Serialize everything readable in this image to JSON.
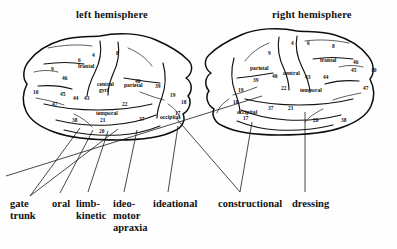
{
  "figure": {
    "background_color": "#fefefe",
    "ink_color": "#111111"
  },
  "titles": {
    "left": "left hemisphere",
    "right": "right hemisphere"
  },
  "hemispheres": {
    "left": {
      "title": "left hemisphere",
      "lobe_labels": [
        {
          "text": "frontal",
          "x": 78,
          "y": 68
        },
        {
          "text": "central",
          "x": 97,
          "y": 86
        },
        {
          "text": "gyri",
          "x": 99,
          "y": 92
        },
        {
          "text": "parietal",
          "x": 124,
          "y": 87
        },
        {
          "text": "temporal",
          "x": 96,
          "y": 115
        },
        {
          "text": "occipital",
          "x": 160,
          "y": 119
        }
      ],
      "brodmann_areas": [
        {
          "num": "4",
          "x": 92,
          "y": 57
        },
        {
          "num": "6",
          "x": 78,
          "y": 62
        },
        {
          "num": "8",
          "x": 116,
          "y": 55
        },
        {
          "num": "9",
          "x": 51,
          "y": 71
        },
        {
          "num": "46",
          "x": 62,
          "y": 80
        },
        {
          "num": "10",
          "x": 33,
          "y": 94
        },
        {
          "num": "45",
          "x": 60,
          "y": 96
        },
        {
          "num": "44",
          "x": 73,
          "y": 100
        },
        {
          "num": "43",
          "x": 84,
          "y": 100
        },
        {
          "num": "40",
          "x": 135,
          "y": 83
        },
        {
          "num": "39",
          "x": 155,
          "y": 88
        },
        {
          "num": "19",
          "x": 170,
          "y": 97
        },
        {
          "num": "18",
          "x": 181,
          "y": 104
        },
        {
          "num": "17",
          "x": 175,
          "y": 115
        },
        {
          "num": "47",
          "x": 52,
          "y": 106
        },
        {
          "num": "22",
          "x": 122,
          "y": 106
        },
        {
          "num": "21",
          "x": 100,
          "y": 122
        },
        {
          "num": "37",
          "x": 139,
          "y": 121
        },
        {
          "num": "38",
          "x": 72,
          "y": 122
        },
        {
          "num": "20",
          "x": 99,
          "y": 133
        }
      ]
    },
    "right": {
      "title": "right hemisphere",
      "lobe_labels": [
        {
          "text": "parietal",
          "x": 250,
          "y": 70
        },
        {
          "text": "central",
          "x": 283,
          "y": 75
        },
        {
          "text": "frontal",
          "x": 320,
          "y": 62
        },
        {
          "text": "temporal",
          "x": 300,
          "y": 92
        },
        {
          "text": "occipital",
          "x": 237,
          "y": 114
        }
      ],
      "brodmann_areas": [
        {
          "num": "4",
          "x": 291,
          "y": 45
        },
        {
          "num": "6",
          "x": 307,
          "y": 45
        },
        {
          "num": "8",
          "x": 332,
          "y": 48
        },
        {
          "num": "9",
          "x": 268,
          "y": 55
        },
        {
          "num": "46",
          "x": 353,
          "y": 64
        },
        {
          "num": "45",
          "x": 351,
          "y": 72
        },
        {
          "num": "10",
          "x": 371,
          "y": 72
        },
        {
          "num": "47",
          "x": 363,
          "y": 90
        },
        {
          "num": "44",
          "x": 323,
          "y": 79
        },
        {
          "num": "43",
          "x": 305,
          "y": 79
        },
        {
          "num": "40",
          "x": 272,
          "y": 78
        },
        {
          "num": "39",
          "x": 253,
          "y": 82
        },
        {
          "num": "19",
          "x": 238,
          "y": 92
        },
        {
          "num": "18",
          "x": 233,
          "y": 104
        },
        {
          "num": "17",
          "x": 243,
          "y": 120
        },
        {
          "num": "22",
          "x": 281,
          "y": 90
        },
        {
          "num": "37",
          "x": 268,
          "y": 110
        },
        {
          "num": "21",
          "x": 288,
          "y": 110
        },
        {
          "num": "20",
          "x": 313,
          "y": 122
        },
        {
          "num": "38",
          "x": 341,
          "y": 122
        }
      ]
    }
  },
  "apraxia_labels": [
    {
      "id": "gate-trunk",
      "lines": [
        "gate",
        "trunk"
      ],
      "x": 10,
      "y": 198
    },
    {
      "id": "oral",
      "lines": [
        "oral"
      ],
      "x": 52,
      "y": 198
    },
    {
      "id": "limb-kinetic",
      "lines": [
        "limb-",
        "kinetic"
      ],
      "x": 76,
      "y": 198
    },
    {
      "id": "ideo-motor",
      "lines": [
        "ideo-",
        "motor",
        "apraxia"
      ],
      "x": 113,
      "y": 198
    },
    {
      "id": "ideational",
      "lines": [
        "ideational"
      ],
      "x": 153,
      "y": 198
    },
    {
      "id": "constructional",
      "lines": [
        "constructional"
      ],
      "x": 218,
      "y": 198
    },
    {
      "id": "dressing",
      "lines": [
        "dressing"
      ],
      "x": 292,
      "y": 198
    }
  ],
  "leader_lines": [
    {
      "from_label": "gate-trunk",
      "points": "30,196 80,128"
    },
    {
      "from_label": "gate-trunk",
      "points": "30,196 118,129"
    },
    {
      "from_label": "oral",
      "points": "60,193 93,130"
    },
    {
      "from_label": "limb-kinetic",
      "points": "88,192 108,131"
    },
    {
      "from_label": "ideo-motor",
      "points": "124,192 137,130"
    },
    {
      "from_label": "ideational",
      "points": "168,192 178,126"
    },
    {
      "from_label": "constructional",
      "points": "240,192 176,118"
    },
    {
      "from_label": "constructional",
      "points": "240,192 252,122"
    },
    {
      "from_label": "dressing",
      "points": "305,192 305,112"
    },
    {
      "from_label": "constructional",
      "points": "6,176 262,96"
    }
  ]
}
